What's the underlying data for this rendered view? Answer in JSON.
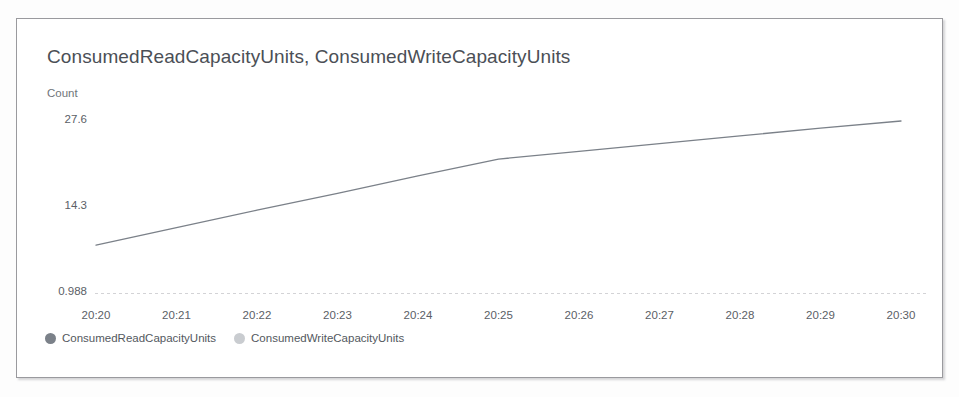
{
  "card": {
    "title": "ConsumedReadCapacityUnits, ConsumedWriteCapacityUnits",
    "y_unit_label": "Count"
  },
  "colors": {
    "card_border": "#9a9a9e",
    "card_background": "#ffffff",
    "title_text": "#4b4f56",
    "tick_text": "#5b6066",
    "axis_line": "#96969e",
    "read_series": "#7b8189",
    "write_series": "#c9ccd0"
  },
  "legend": {
    "position": "bottom-left",
    "items": [
      {
        "label": "ConsumedReadCapacityUnits",
        "color": "#7b8189",
        "marker": "circle"
      },
      {
        "label": "ConsumedWriteCapacityUnits",
        "color": "#c9ccd0",
        "marker": "circle"
      }
    ]
  },
  "chart_data": {
    "type": "line",
    "title": "ConsumedReadCapacityUnits, ConsumedWriteCapacityUnits",
    "xlabel": "",
    "ylabel": "Count",
    "x": [
      "20:20",
      "20:21",
      "20:22",
      "20:23",
      "20:24",
      "20:25",
      "20:26",
      "20:27",
      "20:28",
      "20:29",
      "20:30"
    ],
    "ytick_labels": [
      "0.988",
      "14.3",
      "27.6"
    ],
    "ytick_values": [
      0.988,
      14.3,
      27.6
    ],
    "ylim": [
      0.988,
      27.6
    ],
    "grid": false,
    "series": [
      {
        "name": "ConsumedReadCapacityUnits",
        "color": "#7b8189",
        "values": [
          8.4,
          11.1,
          13.8,
          16.4,
          19.1,
          21.7,
          22.9,
          24.1,
          25.3,
          26.5,
          27.6
        ]
      },
      {
        "name": "ConsumedWriteCapacityUnits",
        "color": "#c9ccd0",
        "values": [
          null,
          null,
          null,
          null,
          null,
          null,
          null,
          null,
          null,
          null,
          null
        ]
      }
    ]
  }
}
